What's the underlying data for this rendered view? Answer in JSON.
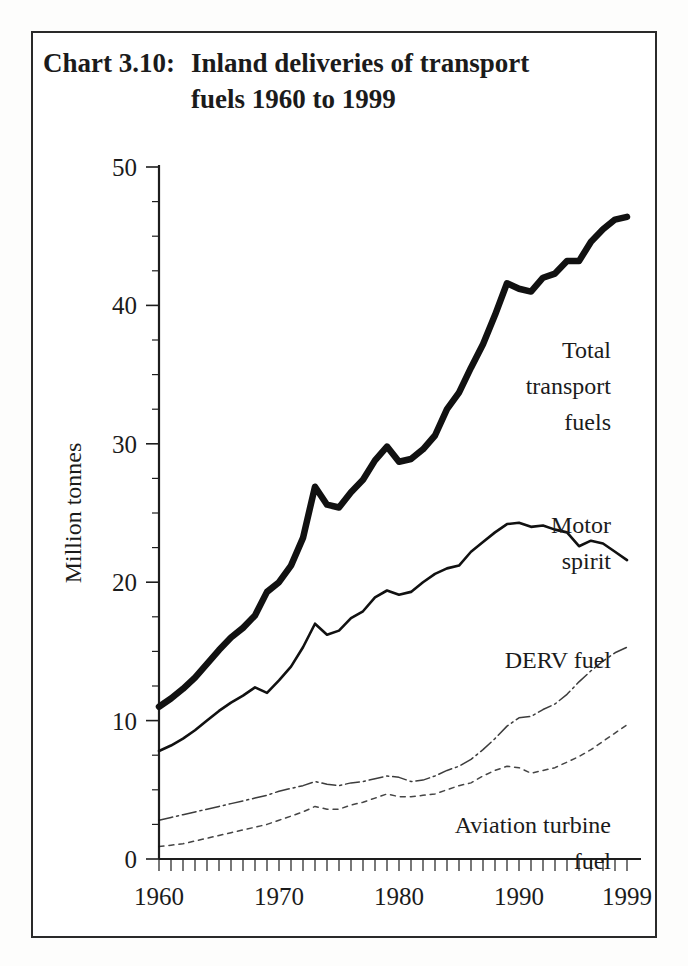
{
  "title": {
    "prefix": "Chart 3.10:",
    "line1": "Inland deliveries of transport",
    "line2": "fuels 1960 to 1999"
  },
  "chart_data": {
    "type": "line",
    "xlabel": "",
    "ylabel": "Million tonnes",
    "xlim": [
      1960,
      1999
    ],
    "ylim": [
      0,
      50
    ],
    "yticks": [
      0,
      10,
      20,
      30,
      40,
      50
    ],
    "ytick_labels": [
      "0",
      "10",
      "20",
      "30",
      "40",
      "50"
    ],
    "yminor_step": 2.5,
    "xticks": [
      1960,
      1970,
      1980,
      1990,
      1999
    ],
    "xtick_labels": [
      "1960",
      "1970",
      "1980",
      "1990",
      "1999"
    ],
    "xminor_step": 1,
    "grid": false,
    "legend": "inline-labels",
    "x": [
      1960,
      1961,
      1962,
      1963,
      1964,
      1965,
      1966,
      1967,
      1968,
      1969,
      1970,
      1971,
      1972,
      1973,
      1974,
      1975,
      1976,
      1977,
      1978,
      1979,
      1980,
      1981,
      1982,
      1983,
      1984,
      1985,
      1986,
      1987,
      1988,
      1989,
      1990,
      1991,
      1992,
      1993,
      1994,
      1995,
      1996,
      1997,
      1998,
      1999
    ],
    "series": [
      {
        "name": "Total transport fuels",
        "style": "thick-solid",
        "color": "#111111",
        "label_lines": [
          "Total",
          "transport",
          "fuels"
        ],
        "values": [
          11.0,
          11.6,
          12.3,
          13.1,
          14.1,
          15.1,
          16.0,
          16.7,
          17.6,
          19.3,
          20.0,
          21.2,
          23.2,
          26.9,
          25.6,
          25.4,
          26.5,
          27.4,
          28.8,
          29.8,
          28.7,
          28.9,
          29.6,
          30.6,
          32.5,
          33.7,
          35.5,
          37.2,
          39.3,
          41.6,
          41.2,
          41.0,
          42.0,
          42.3,
          43.2,
          43.2,
          44.6,
          45.5,
          46.2,
          46.4
        ]
      },
      {
        "name": "Motor spirit",
        "style": "thin-solid",
        "color": "#111111",
        "label_lines": [
          "Motor",
          "spirit"
        ],
        "values": [
          7.8,
          8.2,
          8.7,
          9.3,
          10.0,
          10.7,
          11.3,
          11.8,
          12.4,
          12.0,
          12.9,
          13.9,
          15.3,
          17.0,
          16.2,
          16.5,
          17.4,
          17.9,
          18.9,
          19.4,
          19.1,
          19.3,
          20.0,
          20.6,
          21.0,
          21.2,
          22.2,
          22.9,
          23.6,
          24.2,
          24.3,
          24.0,
          24.1,
          23.8,
          23.6,
          22.6,
          23.0,
          22.8,
          22.2,
          21.6
        ]
      },
      {
        "name": "DERV fuel",
        "style": "dash-dot",
        "color": "#111111",
        "label_lines": [
          "DERV fuel"
        ],
        "values": [
          2.8,
          3.0,
          3.2,
          3.4,
          3.6,
          3.8,
          4.0,
          4.2,
          4.4,
          4.6,
          4.9,
          5.1,
          5.3,
          5.6,
          5.4,
          5.3,
          5.5,
          5.6,
          5.8,
          6.0,
          5.9,
          5.6,
          5.7,
          6.0,
          6.4,
          6.7,
          7.2,
          7.9,
          8.7,
          9.6,
          10.2,
          10.3,
          10.8,
          11.2,
          11.9,
          12.8,
          13.6,
          14.3,
          14.9,
          15.3
        ]
      },
      {
        "name": "Aviation turbine fuel",
        "style": "dotted",
        "color": "#111111",
        "label_lines": [
          "Aviation turbine",
          "fuel"
        ],
        "values": [
          0.9,
          1.0,
          1.1,
          1.3,
          1.5,
          1.7,
          1.9,
          2.1,
          2.3,
          2.5,
          2.8,
          3.1,
          3.4,
          3.8,
          3.6,
          3.6,
          3.9,
          4.1,
          4.4,
          4.7,
          4.5,
          4.5,
          4.6,
          4.7,
          5.0,
          5.3,
          5.5,
          6.0,
          6.4,
          6.7,
          6.6,
          6.2,
          6.4,
          6.6,
          7.0,
          7.4,
          7.9,
          8.5,
          9.1,
          9.7
        ]
      }
    ]
  }
}
